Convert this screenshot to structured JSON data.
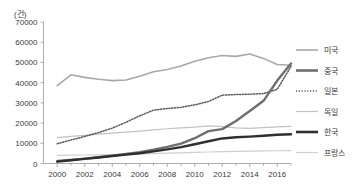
{
  "chart_data": {
    "type": "line",
    "title": "",
    "subtitle": "",
    "xlabel": "",
    "ylabel": "",
    "y_unit_label": "(건)",
    "xlim": [
      1999,
      2017
    ],
    "ylim": [
      0,
      70000
    ],
    "grid": false,
    "legend_position": "right",
    "y_ticks": [
      0,
      10000,
      20000,
      30000,
      40000,
      50000,
      60000,
      70000
    ],
    "y_tick_labels": [
      "0",
      "10000",
      "20000",
      "30000",
      "40000",
      "50000",
      "60000",
      "70000"
    ],
    "x_ticks": [
      2000,
      2002,
      2004,
      2006,
      2008,
      2010,
      2012,
      2014,
      2016
    ],
    "x_tick_labels": [
      "2000",
      "2002",
      "2004",
      "2006",
      "2008",
      "2010",
      "2012",
      "2014",
      "2016"
    ],
    "x_minor_ticks": [
      2001,
      2003,
      2005,
      2007,
      2009,
      2011,
      2013,
      2015,
      2017
    ],
    "x": [
      2000,
      2001,
      2002,
      2003,
      2004,
      2005,
      2006,
      2007,
      2008,
      2009,
      2010,
      2011,
      2012,
      2013,
      2014,
      2015,
      2016,
      2017
    ],
    "series": [
      {
        "name": "미국",
        "color": "#a8a8a8",
        "width": 1.6,
        "dash": "none",
        "values": [
          38500,
          43900,
          42600,
          41700,
          41000,
          41300,
          43200,
          45400,
          46500,
          48200,
          50600,
          52300,
          53400,
          53000,
          54200,
          52000,
          49000,
          48600
        ]
      },
      {
        "name": "중국",
        "color": "#6e6e6e",
        "width": 2.4,
        "dash": "none",
        "values": [
          1200,
          1800,
          2400,
          3100,
          3900,
          4700,
          5600,
          6800,
          8200,
          9800,
          12500,
          16000,
          17000,
          21000,
          26000,
          31000,
          41000,
          49500
        ]
      },
      {
        "name": "일본",
        "color": "#5a5a5a",
        "width": 1.5,
        "dash": "1.2,1.6",
        "values": [
          9800,
          11600,
          13400,
          15300,
          17500,
          20400,
          23600,
          26400,
          27200,
          27800,
          29000,
          30700,
          33800,
          34100,
          34300,
          34600,
          36700,
          48000
        ]
      },
      {
        "name": "독일",
        "color": "#c2c2c2",
        "width": 1.2,
        "dash": "none",
        "values": [
          12800,
          13400,
          13900,
          14500,
          15000,
          15500,
          16000,
          16600,
          17200,
          17600,
          18000,
          18600,
          18200,
          17600,
          17400,
          17700,
          18100,
          18400
        ]
      },
      {
        "name": "한국",
        "color": "#2f2f2f",
        "width": 2.4,
        "dash": "none",
        "values": [
          900,
          1600,
          2300,
          3000,
          3700,
          4400,
          5100,
          6000,
          7000,
          8100,
          9500,
          11000,
          12400,
          13000,
          13300,
          13700,
          14200,
          14500
        ]
      },
      {
        "name": "프랑스",
        "color": "#cfcfcf",
        "width": 1.2,
        "dash": "none",
        "values": [
          4000,
          4100,
          4200,
          4300,
          4400,
          4500,
          4700,
          4900,
          5100,
          5300,
          5500,
          5700,
          5900,
          6000,
          6100,
          6200,
          6300,
          6400
        ]
      }
    ],
    "legend": [
      {
        "label": "미국",
        "color": "#a8a8a8",
        "width": 1.6,
        "dash": "none"
      },
      {
        "label": "중국",
        "color": "#6e6e6e",
        "width": 2.6,
        "dash": "none"
      },
      {
        "label": "일본",
        "color": "#5a5a5a",
        "width": 1.5,
        "dash": "1.2,1.6"
      },
      {
        "label": "독일",
        "color": "#c2c2c2",
        "width": 1.2,
        "dash": "none"
      },
      {
        "label": "한국",
        "color": "#2f2f2f",
        "width": 2.6,
        "dash": "none"
      },
      {
        "label": "프랑스",
        "color": "#cfcfcf",
        "width": 1.2,
        "dash": "none"
      }
    ],
    "colors": {
      "axis": "#9a9a9a",
      "text": "#3a3a3a",
      "background": "#ffffff"
    }
  }
}
